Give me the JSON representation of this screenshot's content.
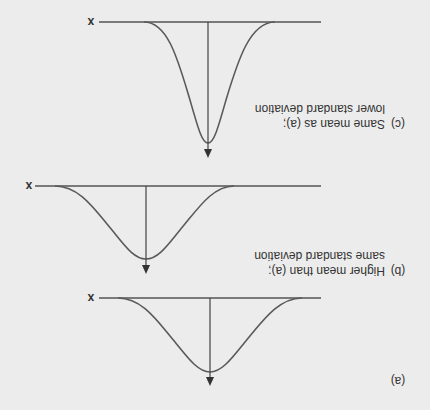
{
  "figure": {
    "orientation": "rotated-180",
    "colors": {
      "background": "#ececec",
      "line": "#555555",
      "text": "#333333"
    },
    "panels": [
      {
        "id": "a",
        "label": "(a)",
        "axis_label": "x",
        "caption_line1": "",
        "caption_line2": ""
      },
      {
        "id": "b",
        "label": "(b)",
        "axis_label": "x",
        "caption_line1": "Higher mean than (a);",
        "caption_line2": "same standard deviation"
      },
      {
        "id": "c",
        "label": "(c)",
        "axis_label": "x",
        "caption_line1": "Same mean as (a);",
        "caption_line2": "lower standard deviation"
      }
    ]
  }
}
